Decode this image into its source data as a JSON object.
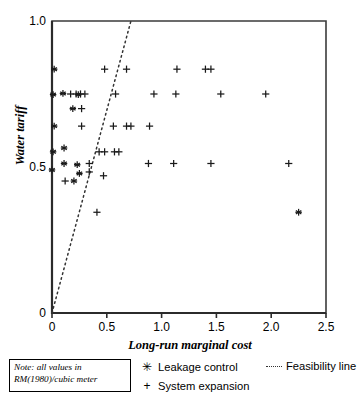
{
  "chart_data": {
    "type": "scatter",
    "title": "",
    "xlabel": "Long-run marginal cost",
    "ylabel": "Water tariff",
    "xlim": [
      0,
      2.5
    ],
    "ylim": [
      0,
      1.0
    ],
    "xticks": [
      "0",
      "0.5",
      "1.0",
      "1.5",
      "2.0",
      "2.5"
    ],
    "xtick_values": [
      0,
      0.5,
      1.0,
      1.5,
      2.0,
      2.5
    ],
    "yticks": [
      "0",
      "0.5",
      "1.0"
    ],
    "ytick_values": [
      0,
      0.5,
      1.0
    ],
    "grid": false,
    "legend_position": "below-axes",
    "series": [
      {
        "name": "Leakage control",
        "marker": "asterisk",
        "points": [
          [
            0.02,
            0.835
          ],
          [
            0.01,
            0.748
          ],
          [
            0.1,
            0.752
          ],
          [
            0.24,
            0.748
          ],
          [
            0.19,
            0.7
          ],
          [
            0.02,
            0.64
          ],
          [
            0.01,
            0.552
          ],
          [
            0.11,
            0.565
          ],
          [
            0.11,
            0.512
          ],
          [
            0.23,
            0.508
          ],
          [
            0.0,
            0.49
          ],
          [
            0.25,
            0.478
          ],
          [
            0.2,
            0.452
          ],
          [
            2.25,
            0.345
          ]
        ]
      },
      {
        "name": "System expansion",
        "marker": "plus",
        "points": [
          [
            0.48,
            0.835
          ],
          [
            0.68,
            0.835
          ],
          [
            1.14,
            0.835
          ],
          [
            1.4,
            0.835
          ],
          [
            1.45,
            0.835
          ],
          [
            0.17,
            0.75
          ],
          [
            0.22,
            0.75
          ],
          [
            0.26,
            0.75
          ],
          [
            0.3,
            0.75
          ],
          [
            0.58,
            0.75
          ],
          [
            0.93,
            0.75
          ],
          [
            1.13,
            0.75
          ],
          [
            1.54,
            0.75
          ],
          [
            1.95,
            0.75
          ],
          [
            0.27,
            0.7
          ],
          [
            0.27,
            0.64
          ],
          [
            0.56,
            0.64
          ],
          [
            0.68,
            0.64
          ],
          [
            0.72,
            0.64
          ],
          [
            0.89,
            0.64
          ],
          [
            0.43,
            0.552
          ],
          [
            0.48,
            0.552
          ],
          [
            0.57,
            0.552
          ],
          [
            0.61,
            0.552
          ],
          [
            0.34,
            0.512
          ],
          [
            0.88,
            0.512
          ],
          [
            1.11,
            0.512
          ],
          [
            1.45,
            0.512
          ],
          [
            2.16,
            0.512
          ],
          [
            0.34,
            0.483
          ],
          [
            0.47,
            0.47
          ],
          [
            0.12,
            0.452
          ],
          [
            0.41,
            0.345
          ]
        ]
      }
    ],
    "feasibility_line": {
      "name": "Feasibility line",
      "style": "dotted",
      "from": [
        0,
        0
      ],
      "to": [
        0.72,
        1.0
      ]
    }
  },
  "note": {
    "line1": "Note: all values in",
    "line2": "RM(1980)/cubic meter"
  },
  "legend": {
    "leakage_label": "Leakage control",
    "leakage_symbol": "✳",
    "expansion_label": "System expansion",
    "expansion_symbol": "+",
    "feasibility_label": "Feasibility line"
  }
}
